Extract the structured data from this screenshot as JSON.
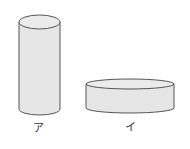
{
  "figure": {
    "shapes": [
      {
        "name": "tall-cylinder",
        "label": "ア"
      },
      {
        "name": "flat-cylinder",
        "label": "イ"
      }
    ],
    "colors": {
      "fill": "#e6e6e6",
      "top_fill": "#ebebeb",
      "stroke": "#555555"
    }
  }
}
